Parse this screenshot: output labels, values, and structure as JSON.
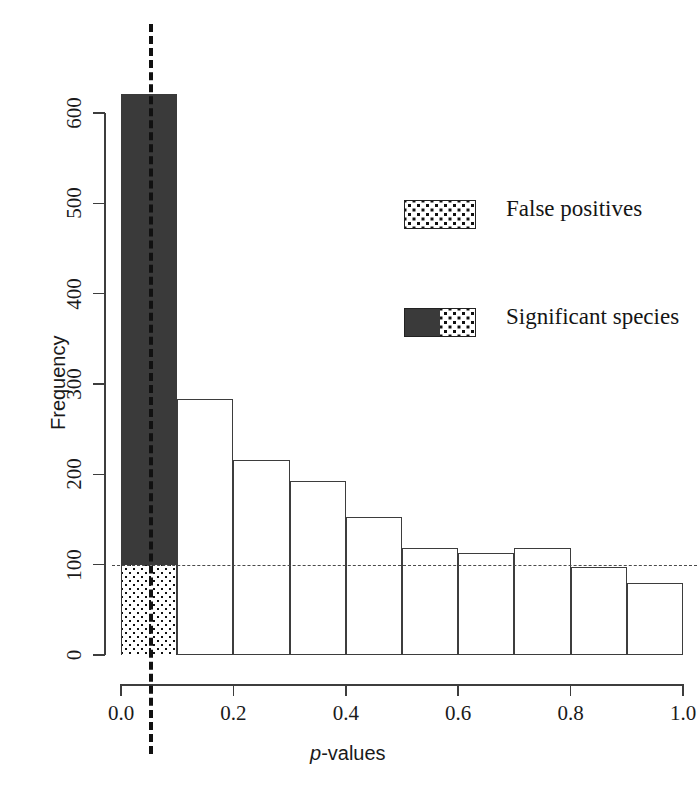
{
  "chart_data": {
    "type": "bar",
    "title": "",
    "subtitle": "",
    "xlabel": "p-values",
    "xlabel_italic_prefix": "p",
    "xlabel_rest": "-values",
    "ylabel": "Frequency",
    "xlim": [
      0.0,
      1.0
    ],
    "ylim": [
      0,
      660
    ],
    "grid": false,
    "bin_width": 0.1,
    "bin_edges": [
      0.0,
      0.1,
      0.2,
      0.3,
      0.4,
      0.5,
      0.6,
      0.7,
      0.8,
      0.9,
      1.0
    ],
    "categories": [
      "0.0-0.1",
      "0.1-0.2",
      "0.2-0.3",
      "0.3-0.4",
      "0.4-0.5",
      "0.5-0.6",
      "0.6-0.7",
      "0.7-0.8",
      "0.8-0.9",
      "0.9-1.0"
    ],
    "values": [
      620,
      283,
      216,
      193,
      153,
      119,
      113,
      118,
      97,
      80
    ],
    "stacked_first_bin": {
      "false_positives": 100,
      "significant_species": 520,
      "total": 620
    },
    "xticks": [
      0.0,
      0.2,
      0.4,
      0.6,
      0.8,
      1.0
    ],
    "xtick_labels": [
      "0.0",
      "0.2",
      "0.4",
      "0.6",
      "0.8",
      "1.0"
    ],
    "yticks": [
      0,
      100,
      200,
      300,
      400,
      500,
      600
    ],
    "ytick_labels": [
      "0",
      "100",
      "200",
      "300",
      "400",
      "500",
      "600"
    ],
    "annotations": [
      {
        "name": "significance-threshold-line",
        "type": "vline",
        "value": 0.05,
        "style": "dashed",
        "color": "#111111"
      },
      {
        "name": "expected-false-positive-line",
        "type": "hline",
        "value": 100,
        "style": "dashed",
        "color": "#4a4a4a"
      }
    ],
    "legend": {
      "position": "upper-right",
      "entries": [
        {
          "label": "False positives",
          "swatch": "dotted"
        },
        {
          "label": "Significant species",
          "swatch": "half-dark-half-dotted"
        }
      ]
    },
    "colors": {
      "bar_outline": "#3d3d3d",
      "bar_fill": "#ffffff",
      "significant_fill": "#3a3a3a",
      "false_positive_fill": "#ffffff",
      "dot_color": "#111111",
      "background": "#ffffff"
    }
  }
}
